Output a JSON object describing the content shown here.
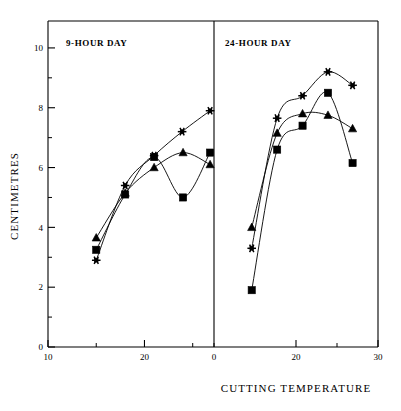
{
  "figure": {
    "background": "#ffffff",
    "ink": "#000000",
    "width": 401,
    "height": 411
  },
  "axes": {
    "y_label": "CENTIMETRES",
    "x_label": "CUTTING  TEMPERATURE",
    "y_ticks": [
      0,
      2,
      4,
      6,
      8,
      10
    ],
    "y_minor_ticks": [
      1,
      3,
      5,
      7,
      9
    ],
    "y_range": [
      0,
      10.9
    ],
    "left_x_ticks": [
      10,
      20
    ],
    "left_x_minor_ticks": [
      15,
      25
    ],
    "left_x_range": [
      10,
      27
    ],
    "right_x_ticks": [
      0,
      20,
      30
    ],
    "right_x_minor_ticks": [
      10,
      25
    ],
    "right_x_range": [
      10,
      30
    ]
  },
  "panels": [
    {
      "id": "left",
      "title": "9-HOUR DAY"
    },
    {
      "id": "right",
      "title": "24-HOUR DAY"
    }
  ],
  "chart_data": {
    "type": "line",
    "title": "",
    "xlabel": "CUTTING  TEMPERATURE",
    "ylabel": "CENTIMETRES",
    "ylim": [
      0,
      10.9
    ],
    "grid": false,
    "legend": "none",
    "marker_styles": [
      "square",
      "triangle",
      "star"
    ],
    "panels": [
      {
        "name": "9-HOUR DAY",
        "xlim": [
          10,
          27
        ],
        "xticks": [
          10,
          20
        ],
        "series": [
          {
            "name": "square",
            "marker": "square",
            "x": [
              15.0,
              18.0,
              21.0,
              24.0,
              26.8
            ],
            "y": [
              3.25,
              5.1,
              6.35,
              5.0,
              6.5
            ]
          },
          {
            "name": "triangle",
            "marker": "triangle",
            "x": [
              15.0,
              18.0,
              21.0,
              24.0,
              26.8
            ],
            "y": [
              3.65,
              5.15,
              6.0,
              6.5,
              6.1
            ]
          },
          {
            "name": "star",
            "marker": "star",
            "x": [
              15.0,
              18.0,
              21.0,
              23.9,
              26.8
            ],
            "y": [
              2.9,
              5.4,
              6.4,
              7.2,
              7.9
            ]
          }
        ]
      },
      {
        "name": "24-HOUR DAY",
        "xlim": [
          10,
          30
        ],
        "xticks": [
          20,
          30
        ],
        "series": [
          {
            "name": "square",
            "marker": "square",
            "x": [
              14.6,
              17.7,
              20.8,
              23.9,
              26.9
            ],
            "y": [
              1.9,
              6.6,
              7.4,
              8.5,
              6.15
            ]
          },
          {
            "name": "triangle",
            "marker": "triangle",
            "x": [
              14.6,
              17.7,
              20.8,
              23.9,
              26.9
            ],
            "y": [
              4.0,
              7.15,
              7.8,
              7.75,
              7.3
            ]
          },
          {
            "name": "star",
            "marker": "star",
            "x": [
              14.6,
              17.7,
              20.8,
              23.9,
              26.9
            ],
            "y": [
              3.3,
              7.65,
              8.4,
              9.2,
              8.75
            ]
          }
        ]
      }
    ]
  }
}
